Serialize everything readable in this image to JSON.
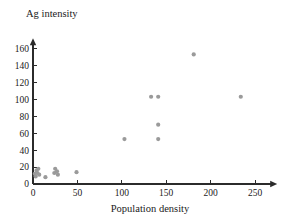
{
  "chart_data": {
    "type": "scatter",
    "title": "",
    "xlabel": "Population density",
    "ylabel": "Ag intensity",
    "xlim": [
      0,
      275
    ],
    "ylim": [
      0,
      172
    ],
    "xticks": [
      0,
      50,
      100,
      150,
      200,
      250
    ],
    "xtick_labels": [
      "0",
      "50",
      "100",
      "150",
      "200",
      "250"
    ],
    "yticks": [
      0,
      20,
      40,
      60,
      80,
      100,
      120,
      140,
      160
    ],
    "ytick_labels": [
      "0",
      "20",
      "40",
      "60",
      "80",
      "100",
      "120",
      "140",
      "160"
    ],
    "grid": false,
    "legend": null,
    "marker_color": "#9a9a9a",
    "axis_color": "#2b2b2b",
    "points": [
      {
        "x": 2,
        "y": 12
      },
      {
        "x": 3,
        "y": 9
      },
      {
        "x": 4,
        "y": 16
      },
      {
        "x": 5,
        "y": 13
      },
      {
        "x": 6,
        "y": 18
      },
      {
        "x": 7,
        "y": 11
      },
      {
        "x": 14,
        "y": 8
      },
      {
        "x": 24,
        "y": 13
      },
      {
        "x": 25,
        "y": 18
      },
      {
        "x": 27,
        "y": 15
      },
      {
        "x": 28,
        "y": 11
      },
      {
        "x": 49,
        "y": 14
      },
      {
        "x": 103,
        "y": 53
      },
      {
        "x": 133,
        "y": 103
      },
      {
        "x": 141,
        "y": 103
      },
      {
        "x": 141,
        "y": 70
      },
      {
        "x": 141,
        "y": 53
      },
      {
        "x": 181,
        "y": 153
      },
      {
        "x": 234,
        "y": 103
      }
    ]
  }
}
